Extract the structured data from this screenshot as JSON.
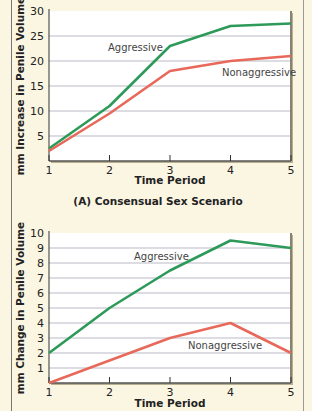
{
  "colors": {
    "background": "#fbf6e2",
    "plot_background": "#ffffff",
    "grid": "#b9b9c6",
    "aggressive": "#2e9a5a",
    "nonaggressive": "#e8685a"
  },
  "chart_data": [
    {
      "type": "line",
      "title": "",
      "caption": "(A) Consensual Sex Scenario",
      "xlabel": "Time Period",
      "ylabel": "mm Increase in Penile Volume",
      "x": [
        1,
        2,
        3,
        4,
        5
      ],
      "xticks": [
        "1",
        "2",
        "3",
        "4",
        "5"
      ],
      "yticks": [
        "5",
        "10",
        "15",
        "20",
        "25",
        "30"
      ],
      "ylim": [
        0,
        30
      ],
      "grid": true,
      "legend": "inline labels",
      "series": [
        {
          "name": "Aggressive",
          "values": [
            2.5,
            11,
            23,
            27,
            27.5
          ]
        },
        {
          "name": "Nonaggressive",
          "values": [
            2,
            9.5,
            18,
            20,
            21
          ]
        }
      ]
    },
    {
      "type": "line",
      "title": "",
      "xlabel": "Time Period",
      "ylabel": "mm Change in Penile Volume",
      "x": [
        1,
        2,
        3,
        4,
        5
      ],
      "xticks": [
        "1",
        "2",
        "3",
        "4",
        "5"
      ],
      "yticks": [
        "1",
        "2",
        "3",
        "4",
        "5",
        "6",
        "7",
        "8",
        "9",
        "10"
      ],
      "ylim": [
        0,
        10
      ],
      "grid": true,
      "legend": "inline labels",
      "series": [
        {
          "name": "Aggressive",
          "values": [
            2,
            5,
            7.5,
            9.5,
            9
          ]
        },
        {
          "name": "Nonaggressive",
          "values": [
            0,
            1.5,
            3,
            4,
            2
          ]
        }
      ]
    }
  ]
}
